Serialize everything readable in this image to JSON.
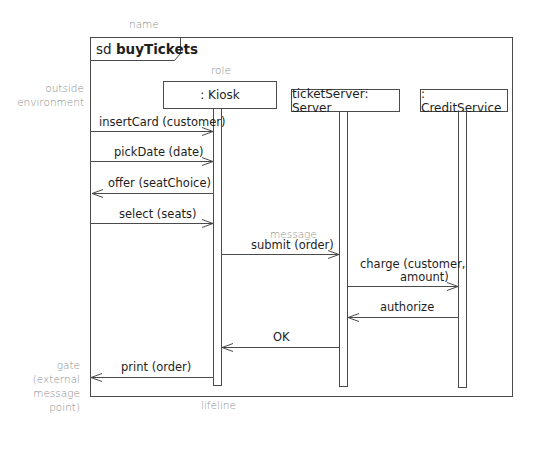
{
  "diagram": {
    "type": "UML sequence diagram",
    "frame": {
      "keyword": "sd",
      "name": "buyTickets"
    },
    "annotations": {
      "name": "name",
      "role": "role",
      "outside_environment": [
        "outside",
        "environment"
      ],
      "message": "message",
      "gate": [
        "gate",
        "(external",
        "message",
        "point)"
      ],
      "lifeline": "lifeline"
    },
    "lifelines": [
      {
        "id": "kiosk",
        "label": ": Kiosk"
      },
      {
        "id": "server",
        "label": "ticketServer: Server"
      },
      {
        "id": "credit",
        "label": ": CreditService"
      }
    ],
    "messages": [
      {
        "label": "insertCard (customer)",
        "from": "environment",
        "to": "kiosk"
      },
      {
        "label": "pickDate (date)",
        "from": "environment",
        "to": "kiosk"
      },
      {
        "label": "offer (seatChoice)",
        "from": "kiosk",
        "to": "environment"
      },
      {
        "label": "select (seats)",
        "from": "environment",
        "to": "kiosk"
      },
      {
        "label": "submit (order)",
        "from": "kiosk",
        "to": "server"
      },
      {
        "label_lines": [
          "charge (customer,",
          "amount)"
        ],
        "from": "server",
        "to": "credit"
      },
      {
        "label": "authorize",
        "from": "credit",
        "to": "server"
      },
      {
        "label": "OK",
        "from": "server",
        "to": "kiosk"
      },
      {
        "label": "print (order)",
        "from": "kiosk",
        "to": "gate"
      }
    ]
  },
  "colors": {
    "line": "#4a4a4a",
    "text": "#1e1e1e",
    "annotation": "#8c8c8c"
  }
}
